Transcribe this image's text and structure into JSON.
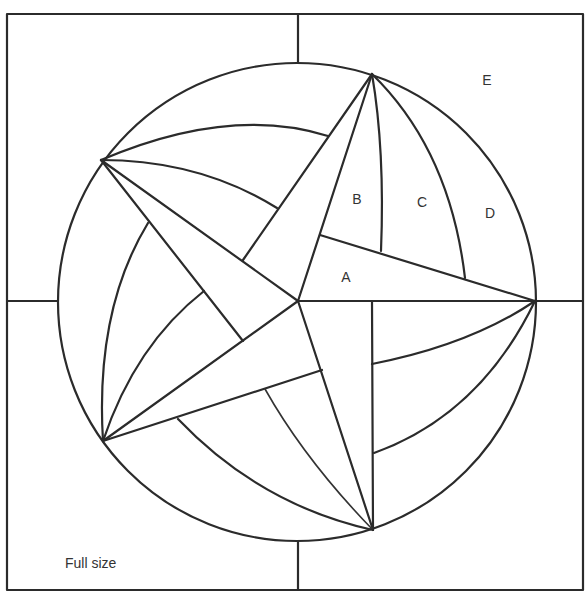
{
  "diagram": {
    "caption": "Full size",
    "stroke_color": "#2b2b2b",
    "background": "#ffffff",
    "frame": {
      "x": 7,
      "y": 14,
      "w": 576,
      "h": 576
    },
    "circle": {
      "cx": 297,
      "cy": 302,
      "r": 239
    },
    "center": [
      298,
      301
    ],
    "star_points": {
      "top": [
        372,
        74
      ],
      "right": [
        535,
        301
      ],
      "bottom": [
        373,
        530
      ],
      "lower_left": [
        103,
        441
      ],
      "upper_left": [
        101,
        160
      ]
    },
    "labels": [
      {
        "id": "A",
        "text": "A",
        "x": 346,
        "y": 282
      },
      {
        "id": "B",
        "text": "B",
        "x": 357,
        "y": 204
      },
      {
        "id": "C",
        "text": "C",
        "x": 422,
        "y": 207
      },
      {
        "id": "D",
        "text": "D",
        "x": 490,
        "y": 218
      },
      {
        "id": "E",
        "text": "E",
        "x": 487,
        "y": 85
      }
    ],
    "caption_pos": {
      "x": 65,
      "y": 568
    }
  }
}
